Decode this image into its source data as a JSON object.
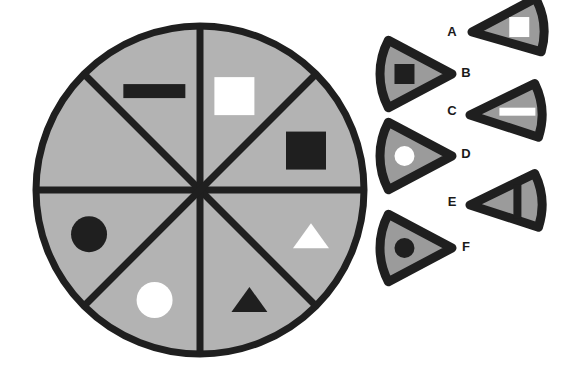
{
  "figure": {
    "background_color": "#ffffff",
    "wedge_fill": "#9b9b9b",
    "disc_fill": "#b3b3b3",
    "outline_color": "#1f1f1f",
    "shape_dark_color": "#1f1f1f",
    "shape_light_color": "#ffffff"
  },
  "disc": {
    "center_x": 200,
    "center_y": 190,
    "radius": 164,
    "stroke_width": 7,
    "sector_count": 8,
    "divider_angles_deg": [
      0,
      45,
      90,
      135,
      180,
      225,
      270,
      315
    ],
    "sectors": [
      {
        "id": "sector-1",
        "position": "top-right-upper",
        "start_deg": -90,
        "end_deg": -45,
        "shape": "square",
        "shape_color": "#ffffff",
        "shape_label": "white square"
      },
      {
        "id": "sector-2",
        "position": "right-upper",
        "start_deg": -45,
        "end_deg": 0,
        "shape": "square",
        "shape_color": "#1f1f1f",
        "shape_label": "black square"
      },
      {
        "id": "sector-3",
        "position": "right-lower",
        "start_deg": 0,
        "end_deg": 45,
        "shape": "triangle",
        "shape_color": "#ffffff",
        "shape_label": "white triangle"
      },
      {
        "id": "sector-4",
        "position": "bottom-right",
        "start_deg": 45,
        "end_deg": 90,
        "shape": "triangle",
        "shape_color": "#1f1f1f",
        "shape_label": "black triangle"
      },
      {
        "id": "sector-5",
        "position": "bottom-left",
        "start_deg": 90,
        "end_deg": 135,
        "shape": "circle",
        "shape_color": "#ffffff",
        "shape_label": "white circle"
      },
      {
        "id": "sector-6",
        "position": "left-lower",
        "start_deg": 135,
        "end_deg": 180,
        "shape": "circle",
        "shape_color": "#1f1f1f",
        "shape_label": "black circle"
      },
      {
        "id": "sector-7",
        "position": "left-upper",
        "start_deg": 180,
        "end_deg": 225,
        "shape": "none",
        "shape_color": "",
        "shape_label": "empty"
      },
      {
        "id": "sector-8",
        "position": "top-left",
        "start_deg": 225,
        "end_deg": 270,
        "shape": "bar",
        "shape_color": "#1f1f1f",
        "shape_label": "black horizontal bar"
      }
    ]
  },
  "options": {
    "count": 6,
    "items": [
      {
        "key": "A",
        "label": "A",
        "label_x": 452,
        "label_y": 33,
        "apex": "left",
        "shape": "square",
        "shape_color": "#ffffff",
        "shape_label": "white square"
      },
      {
        "key": "B",
        "label": "B",
        "label_x": 466,
        "label_y": 74,
        "apex": "right",
        "shape": "square",
        "shape_color": "#1f1f1f",
        "shape_label": "black square"
      },
      {
        "key": "C",
        "label": "C",
        "label_x": 452,
        "label_y": 112,
        "apex": "left",
        "shape": "bar",
        "shape_color": "#ffffff",
        "shape_label": "white horizontal bar"
      },
      {
        "key": "D",
        "label": "D",
        "label_x": 466,
        "label_y": 155,
        "apex": "right",
        "shape": "circle",
        "shape_color": "#ffffff",
        "shape_label": "white circle"
      },
      {
        "key": "E",
        "label": "E",
        "label_x": 452,
        "label_y": 203,
        "apex": "left",
        "shape": "bar-vertical",
        "shape_color": "#1f1f1f",
        "shape_label": "black vertical bar"
      },
      {
        "key": "F",
        "label": "F",
        "label_x": 466,
        "label_y": 248,
        "apex": "right",
        "shape": "circle",
        "shape_color": "#1f1f1f",
        "shape_label": "black circle"
      }
    ]
  }
}
